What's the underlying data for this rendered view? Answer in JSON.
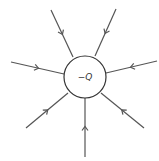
{
  "diagram": {
    "title": "",
    "charge": {
      "label": "−Q",
      "cx": 85,
      "cy": 77,
      "r": 21
    },
    "field_lines": [
      {
        "x1": 51,
        "y1": 10,
        "x2": 73,
        "y2": 57
      },
      {
        "x1": 116,
        "y1": 9,
        "x2": 95,
        "y2": 56
      },
      {
        "x1": 11,
        "y1": 62,
        "x2": 64,
        "y2": 74
      },
      {
        "x1": 157,
        "y1": 61,
        "x2": 106,
        "y2": 73
      },
      {
        "x1": 26,
        "y1": 128,
        "x2": 68,
        "y2": 93
      },
      {
        "x1": 144,
        "y1": 128,
        "x2": 101,
        "y2": 93
      },
      {
        "x1": 85,
        "y1": 157,
        "x2": 85,
        "y2": 98
      }
    ],
    "line_color": "#555555",
    "direction": "inward"
  }
}
